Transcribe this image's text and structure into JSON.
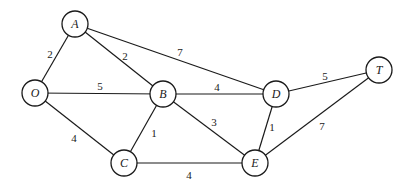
{
  "diagram": {
    "type": "weighted-undirected-graph",
    "colors": {
      "stroke": "#1a1a1a",
      "node_fill": "#ffffff",
      "background": "#ffffff"
    },
    "node_radius": 13,
    "nodes": [
      {
        "id": "O",
        "label": "O",
        "x": 35,
        "y": 93
      },
      {
        "id": "A",
        "label": "A",
        "x": 75,
        "y": 24
      },
      {
        "id": "B",
        "label": "B",
        "x": 163,
        "y": 94
      },
      {
        "id": "C",
        "label": "C",
        "x": 124,
        "y": 163
      },
      {
        "id": "D",
        "label": "D",
        "x": 276,
        "y": 94
      },
      {
        "id": "E",
        "label": "E",
        "x": 255,
        "y": 163
      },
      {
        "id": "T",
        "label": "T",
        "x": 379,
        "y": 70
      }
    ],
    "edges": [
      {
        "from": "O",
        "to": "A",
        "weight": "2",
        "label_x": 50,
        "label_y": 54
      },
      {
        "from": "O",
        "to": "B",
        "weight": "5",
        "label_x": 100,
        "label_y": 86
      },
      {
        "from": "O",
        "to": "C",
        "weight": "4",
        "label_x": 74,
        "label_y": 138
      },
      {
        "from": "A",
        "to": "B",
        "weight": "2",
        "label_x": 125,
        "label_y": 56
      },
      {
        "from": "A",
        "to": "D",
        "weight": "7",
        "label_x": 180,
        "label_y": 52
      },
      {
        "from": "B",
        "to": "C",
        "weight": "1",
        "label_x": 154,
        "label_y": 133
      },
      {
        "from": "B",
        "to": "D",
        "weight": "4",
        "label_x": 217,
        "label_y": 87
      },
      {
        "from": "B",
        "to": "E",
        "weight": "3",
        "label_x": 214,
        "label_y": 122
      },
      {
        "from": "C",
        "to": "E",
        "weight": "4",
        "label_x": 189,
        "label_y": 175
      },
      {
        "from": "D",
        "to": "E",
        "weight": "1",
        "label_x": 272,
        "label_y": 127
      },
      {
        "from": "D",
        "to": "T",
        "weight": "5",
        "label_x": 325,
        "label_y": 76
      },
      {
        "from": "E",
        "to": "T",
        "weight": "7",
        "label_x": 322,
        "label_y": 126
      }
    ]
  }
}
